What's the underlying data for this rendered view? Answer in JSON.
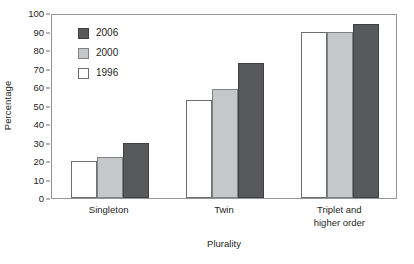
{
  "chart_data": {
    "type": "bar",
    "title": "",
    "subtitle": "",
    "xlabel": "Plurality",
    "ylabel": "Percentage",
    "categories": [
      "Singleton",
      "Twin",
      "Triplet and higher order"
    ],
    "category_lines": [
      [
        "Singleton"
      ],
      [
        "Twin"
      ],
      [
        "Triplet and",
        "higher order"
      ]
    ],
    "series": [
      {
        "name": "1996",
        "values": [
          20,
          53,
          90
        ],
        "color": "#ffffff"
      },
      {
        "name": "2000",
        "values": [
          22,
          59,
          89.5
        ],
        "color": "#c6c7c9"
      },
      {
        "name": "2006",
        "values": [
          30,
          73,
          94
        ],
        "color": "#58595b"
      }
    ],
    "legend_order": [
      "2006",
      "2000",
      "1996"
    ],
    "legend_position": "top-left-inside",
    "ylim": [
      0,
      100
    ],
    "yticks": [
      0,
      10,
      20,
      30,
      40,
      50,
      60,
      70,
      80,
      90,
      100
    ],
    "ytick_labels": [
      "0",
      "10",
      "20",
      "30",
      "40",
      "50",
      "60",
      "70",
      "80",
      "90",
      "100"
    ],
    "grid": false,
    "frame": true,
    "tick_direction": "out"
  },
  "legend": {
    "items": [
      {
        "label": "2006",
        "swatch": "legend-swatch-2006"
      },
      {
        "label": "2000",
        "swatch": "legend-swatch-2000"
      },
      {
        "label": "1996",
        "swatch": "legend-swatch-1996"
      }
    ]
  }
}
